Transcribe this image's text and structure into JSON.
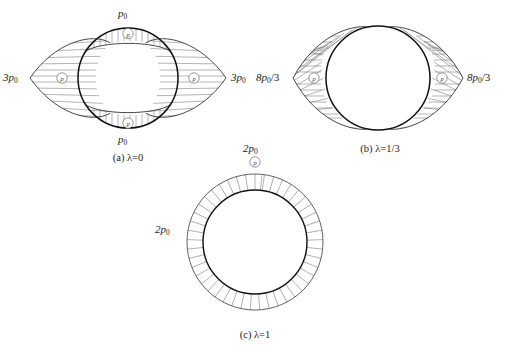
{
  "figure": {
    "background_color": "#ffffff",
    "line_color": "#1a1a1a",
    "hatch_color": "#6b6b6b",
    "panels": [
      {
        "id": "a",
        "caption": "(a) λ=0",
        "lambda_value": "0",
        "labels": [
          {
            "name": "top-pressure-label",
            "text": "p₀",
            "base": "p",
            "sub": "0"
          },
          {
            "name": "bottom-pressure-label",
            "text": "p₀",
            "base": "p",
            "sub": "0"
          },
          {
            "name": "left-pressure-label",
            "text": "3p₀",
            "base": "3p",
            "sub": "0"
          },
          {
            "name": "right-pressure-label",
            "text": "3p₀",
            "base": "3p",
            "sub": "0"
          }
        ],
        "markers": [
          "left-pressure-marker",
          "right-pressure-marker",
          "top-pressure-marker",
          "bottom-pressure-marker"
        ]
      },
      {
        "id": "b",
        "caption": "(b) λ=1/3",
        "lambda_value": "1/3",
        "labels": [
          {
            "name": "left-pressure-label",
            "text": "8p₀/3",
            "base": "8p",
            "sub": "0",
            "suffix": "/3"
          },
          {
            "name": "right-pressure-label",
            "text": "8p₀/3",
            "base": "8p",
            "sub": "0",
            "suffix": "/3"
          }
        ],
        "markers": [
          "left-pressure-marker",
          "right-pressure-marker"
        ]
      },
      {
        "id": "c",
        "caption": "(c) λ=1",
        "lambda_value": "1",
        "labels": [
          {
            "name": "top-pressure-label",
            "text": "2p₀",
            "base": "2p",
            "sub": "0"
          },
          {
            "name": "left-pressure-label",
            "text": "2p₀",
            "base": "2p",
            "sub": "0"
          }
        ],
        "markers": [
          "top-pressure-marker"
        ]
      }
    ],
    "marker_glyph": "circled-p",
    "geometry": {
      "panel_a": {
        "cx": 128,
        "cy": 78,
        "r": 50,
        "lobe_x_tip": 30,
        "lobe_y_tip": 21
      },
      "panel_b": {
        "cx": 378,
        "cy": 78,
        "r": 52,
        "lobe_x_tip": 293
      },
      "panel_c": {
        "cx": 255,
        "cy": 242,
        "r_inner": 52,
        "r_outer": 68
      }
    }
  }
}
